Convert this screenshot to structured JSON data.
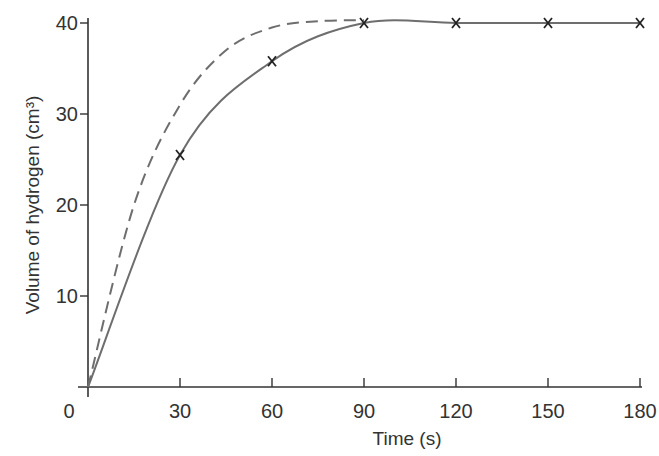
{
  "chart_data": {
    "type": "line",
    "title": "",
    "xlabel": "Time (s)",
    "ylabel": "Volume of hydrogen (cm³)",
    "xlim": [
      0,
      180
    ],
    "ylim": [
      0,
      40
    ],
    "x_ticks": [
      0,
      30,
      60,
      90,
      120,
      150,
      180
    ],
    "y_ticks": [
      10,
      20,
      30,
      40
    ],
    "grid": false,
    "legend": null,
    "series": [
      {
        "name": "measured (solid, with x markers)",
        "style": "solid",
        "markers": "x",
        "x": [
          0,
          30,
          60,
          90,
          120,
          150,
          180
        ],
        "values": [
          0,
          25.5,
          35.8,
          40,
          40,
          40,
          40
        ]
      },
      {
        "name": "faster reaction (dashed)",
        "style": "dashed",
        "markers": "none",
        "x": [
          0,
          15,
          30,
          45,
          60,
          75,
          90
        ],
        "values": [
          0,
          20,
          31,
          37,
          39.5,
          40.2,
          40.3
        ]
      }
    ]
  },
  "axes": {
    "x_label": "Time (s)",
    "y_label": "Volume of hydrogen (cm³)",
    "origin_label": "0",
    "x_tick_labels": [
      "30",
      "60",
      "90",
      "120",
      "150",
      "180"
    ],
    "y_tick_labels": [
      "10",
      "20",
      "30",
      "40"
    ]
  },
  "colors": {
    "axis": "#333333",
    "curve": "#6e6e6e",
    "marker": "#222222"
  }
}
